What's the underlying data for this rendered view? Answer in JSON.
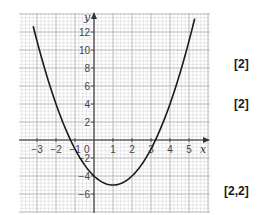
{
  "chart_data": {
    "type": "line",
    "title": "",
    "function": "y = x^2 - 2x - 4",
    "xlabel": "x",
    "ylabel": "y",
    "xlim": [
      -4,
      6
    ],
    "ylim": [
      -8,
      14
    ],
    "grid": true,
    "x_ticks": [
      -3,
      -2,
      -1,
      0,
      1,
      2,
      3,
      4,
      5
    ],
    "x_tick_labels": [
      "−3",
      "−2",
      "−1",
      "0",
      "1",
      "2",
      "3",
      "4",
      "5"
    ],
    "y_ticks": [
      12,
      10,
      8,
      6,
      4,
      2,
      -2,
      -4,
      -6
    ],
    "y_tick_labels": [
      "12",
      "10",
      "8",
      "6",
      "4",
      "2",
      "−2",
      "−4",
      "−6"
    ],
    "origin_label": "0",
    "series": [
      {
        "name": "parabola",
        "x": [
          -3.2,
          -3,
          -2.5,
          -2,
          -1.5,
          -1.24,
          -1,
          -0.5,
          0,
          0.5,
          1,
          1.5,
          2,
          2.5,
          3,
          3.24,
          3.5,
          4,
          4.5,
          5,
          5.3
        ],
        "y": [
          12.64,
          11,
          7.25,
          4,
          1.25,
          0,
          -1,
          -2.75,
          -4,
          -4.75,
          -5,
          -4.75,
          -4,
          -2.75,
          -1,
          0,
          1.25,
          4,
          6.25,
          11,
          13.49
        ]
      }
    ],
    "key_points": {
      "vertex": [
        1,
        -5
      ],
      "y_intercept": [
        0,
        -4
      ],
      "roots": [
        -1.24,
        3.24
      ]
    },
    "colors": {
      "curve": "#1a1a1a",
      "axes": "#333333",
      "grid_minor": "#d4d4d4",
      "grid_major": "#a8a8a8"
    }
  },
  "marks": {
    "q1": "[2]",
    "q2": "[2]",
    "q3": "[2,2]"
  }
}
